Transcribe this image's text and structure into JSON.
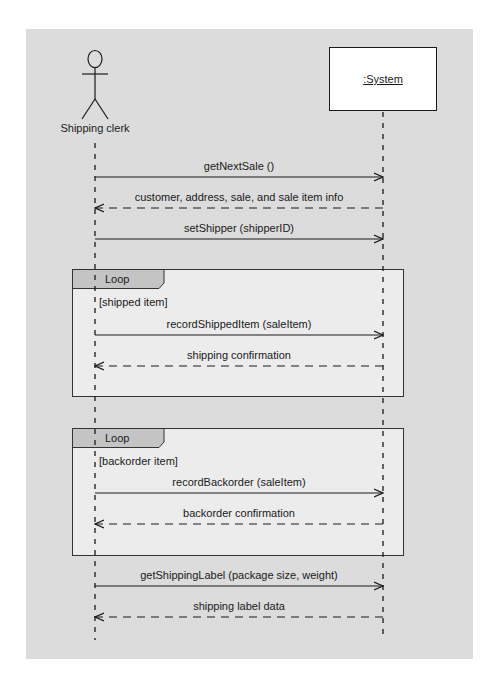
{
  "diagram": {
    "type": "UML sequence diagram",
    "participants": [
      {
        "id": "actor",
        "kind": "actor",
        "label": "Shipping clerk"
      },
      {
        "id": "system",
        "kind": "object",
        "label": ":System"
      }
    ],
    "messages": [
      {
        "label": "getNextSale ()",
        "from": "actor",
        "to": "system",
        "style": "sync"
      },
      {
        "label": "customer, address, sale, and sale item info",
        "from": "system",
        "to": "actor",
        "style": "return"
      },
      {
        "label": "setShipper (shipperID)",
        "from": "actor",
        "to": "system",
        "style": "sync"
      }
    ],
    "loops": [
      {
        "operator": "Loop",
        "guard": "[shipped item]",
        "messages": [
          {
            "label": "recordShippedItem (saleItem)",
            "from": "actor",
            "to": "system",
            "style": "sync"
          },
          {
            "label": "shipping confirmation",
            "from": "system",
            "to": "actor",
            "style": "return"
          }
        ]
      },
      {
        "operator": "Loop",
        "guard": "[backorder item]",
        "messages": [
          {
            "label": "recordBackorder (saleItem)",
            "from": "actor",
            "to": "system",
            "style": "sync"
          },
          {
            "label": "backorder confirmation",
            "from": "system",
            "to": "actor",
            "style": "return"
          }
        ]
      }
    ],
    "final_messages": [
      {
        "label": "getShippingLabel (package size, weight)",
        "from": "actor",
        "to": "system",
        "style": "sync"
      },
      {
        "label": "shipping label data",
        "from": "system",
        "to": "actor",
        "style": "return"
      }
    ]
  },
  "colors": {
    "canvas_bg": "#dcdcdc",
    "frame_bg": "#ececec",
    "tab_bg": "#c4c4c4",
    "line": "#1a1a1a"
  }
}
